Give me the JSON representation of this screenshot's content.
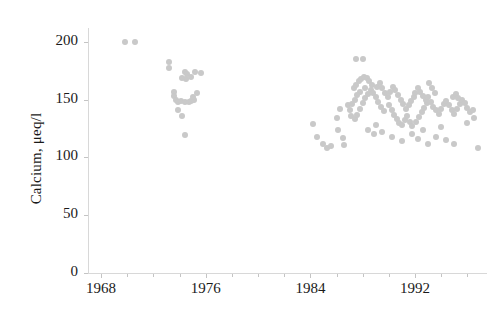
{
  "chart_data": {
    "type": "scatter",
    "title": "",
    "xlabel": "",
    "ylabel": "Calcium, μeq/l",
    "xlim": [
      1967.0,
      1997.5
    ],
    "ylim": [
      0,
      212
    ],
    "grid": false,
    "legend": "none",
    "marker_color": "#c9c9c9",
    "marker_size_px": 6,
    "axis_color": "#d8d8d8",
    "text_color": "#1a1a1a",
    "x_ticks": [
      1968,
      1976,
      1984,
      1992
    ],
    "x_tick_labels": [
      "1968",
      "1976",
      "1984",
      "1992"
    ],
    "x_minor_tick_interval": 2,
    "y_ticks": [
      0,
      50,
      100,
      150,
      200
    ],
    "y_tick_labels": [
      "0",
      "50",
      "100",
      "150",
      "200"
    ],
    "series": [
      {
        "name": "Calcium",
        "points": [
          [
            1969.8,
            200
          ],
          [
            1970.6,
            200
          ],
          [
            1973.2,
            183
          ],
          [
            1973.2,
            177
          ],
          [
            1974.4,
            174
          ],
          [
            1974.6,
            172
          ],
          [
            1974.5,
            168
          ],
          [
            1974.2,
            169
          ],
          [
            1974.9,
            170
          ],
          [
            1975.2,
            174
          ],
          [
            1975.6,
            173
          ],
          [
            1973.6,
            157
          ],
          [
            1973.6,
            153
          ],
          [
            1973.7,
            150
          ],
          [
            1973.9,
            148
          ],
          [
            1974.1,
            149
          ],
          [
            1974.4,
            148
          ],
          [
            1974.7,
            148
          ],
          [
            1974.9,
            149
          ],
          [
            1975.1,
            150
          ],
          [
            1975.3,
            156
          ],
          [
            1975.0,
            152
          ],
          [
            1973.9,
            141
          ],
          [
            1974.2,
            136
          ],
          [
            1974.4,
            119
          ],
          [
            1984.2,
            129
          ],
          [
            1984.5,
            118
          ],
          [
            1985.0,
            112
          ],
          [
            1985.3,
            108
          ],
          [
            1985.6,
            110
          ],
          [
            1986.0,
            134
          ],
          [
            1986.1,
            124
          ],
          [
            1986.3,
            142
          ],
          [
            1986.5,
            117
          ],
          [
            1986.6,
            111
          ],
          [
            1986.9,
            145
          ],
          [
            1987.5,
            185
          ],
          [
            1988.0,
            185
          ],
          [
            1987.3,
            160
          ],
          [
            1987.5,
            163
          ],
          [
            1987.7,
            166
          ],
          [
            1987.9,
            168
          ],
          [
            1988.1,
            170
          ],
          [
            1988.3,
            169
          ],
          [
            1988.5,
            166
          ],
          [
            1988.7,
            163
          ],
          [
            1988.2,
            160
          ],
          [
            1987.8,
            157
          ],
          [
            1987.6,
            154
          ],
          [
            1987.4,
            150
          ],
          [
            1987.2,
            146
          ],
          [
            1987.0,
            141
          ],
          [
            1987.1,
            136
          ],
          [
            1987.4,
            133
          ],
          [
            1987.6,
            137
          ],
          [
            1987.8,
            142
          ],
          [
            1988.0,
            147
          ],
          [
            1988.2,
            151
          ],
          [
            1988.4,
            155
          ],
          [
            1988.6,
            158
          ],
          [
            1988.8,
            156
          ],
          [
            1989.0,
            152
          ],
          [
            1989.2,
            148
          ],
          [
            1989.4,
            144
          ],
          [
            1989.6,
            140
          ],
          [
            1989.1,
            161
          ],
          [
            1989.3,
            164
          ],
          [
            1989.5,
            160
          ],
          [
            1989.7,
            156
          ],
          [
            1989.9,
            152
          ],
          [
            1990.1,
            157
          ],
          [
            1990.3,
            161
          ],
          [
            1990.5,
            158
          ],
          [
            1990.7,
            154
          ],
          [
            1990.9,
            150
          ],
          [
            1991.1,
            146
          ],
          [
            1991.3,
            142
          ],
          [
            1991.5,
            145
          ],
          [
            1991.7,
            149
          ],
          [
            1991.9,
            152
          ],
          [
            1990.0,
            145
          ],
          [
            1990.2,
            141
          ],
          [
            1990.4,
            137
          ],
          [
            1990.6,
            133
          ],
          [
            1990.8,
            130
          ],
          [
            1991.0,
            128
          ],
          [
            1991.2,
            132
          ],
          [
            1991.4,
            136
          ],
          [
            1991.6,
            131
          ],
          [
            1991.8,
            127
          ],
          [
            1992.1,
            131
          ],
          [
            1992.3,
            135
          ],
          [
            1992.5,
            139
          ],
          [
            1992.7,
            143
          ],
          [
            1992.9,
            147
          ],
          [
            1992.0,
            156
          ],
          [
            1992.2,
            160
          ],
          [
            1992.4,
            157
          ],
          [
            1992.6,
            153
          ],
          [
            1992.8,
            150
          ],
          [
            1993.0,
            152
          ],
          [
            1993.2,
            148
          ],
          [
            1993.4,
            144
          ],
          [
            1993.6,
            141
          ],
          [
            1993.8,
            138
          ],
          [
            1994.0,
            142
          ],
          [
            1994.2,
            146
          ],
          [
            1994.4,
            149
          ],
          [
            1994.6,
            145
          ],
          [
            1994.8,
            141
          ],
          [
            1995.0,
            138
          ],
          [
            1995.2,
            142
          ],
          [
            1995.4,
            146
          ],
          [
            1995.6,
            150
          ],
          [
            1995.8,
            147
          ],
          [
            1996.0,
            143
          ],
          [
            1996.2,
            139
          ],
          [
            1996.4,
            141
          ],
          [
            1994.9,
            152
          ],
          [
            1995.1,
            155
          ],
          [
            1995.3,
            151
          ],
          [
            1993.1,
            164
          ],
          [
            1993.3,
            160
          ],
          [
            1993.5,
            156
          ],
          [
            1988.4,
            124
          ],
          [
            1988.9,
            120
          ],
          [
            1989.5,
            122
          ],
          [
            1990.2,
            118
          ],
          [
            1991.0,
            114
          ],
          [
            1992.2,
            116
          ],
          [
            1993.0,
            112
          ],
          [
            1993.6,
            118
          ],
          [
            1994.4,
            115
          ],
          [
            1995.0,
            112
          ],
          [
            1996.8,
            108
          ],
          [
            1989.0,
            128
          ],
          [
            1991.8,
            120
          ],
          [
            1992.6,
            124
          ],
          [
            1994.0,
            126
          ],
          [
            1996.0,
            130
          ],
          [
            1996.5,
            134
          ]
        ]
      }
    ]
  }
}
